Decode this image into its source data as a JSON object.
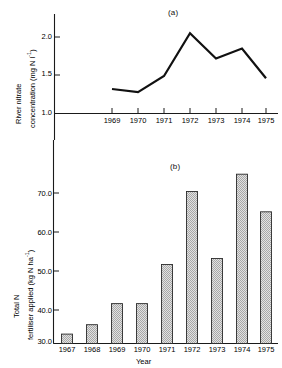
{
  "figure": {
    "panel_a_label": "(a)",
    "panel_b_label": "(b)"
  },
  "panel_a": {
    "ylabel_line1": "River nitrate",
    "ylabel_line2": "concentration (mg N l",
    "ylabel_exp": "-1",
    "ylabel_close": ")",
    "ytick_labels": [
      "2.0",
      "1.5",
      "1.0"
    ],
    "xtick_labels": [
      "1969",
      "1970",
      "1971",
      "1972",
      "1973",
      "1974",
      "1975"
    ]
  },
  "panel_b": {
    "ylabel_line1": "Total N",
    "ylabel_line2": "fertiliser applied (kg N ha",
    "ylabel_exp": "-1",
    "ylabel_close": ")",
    "ytick_labels": [
      "70.0",
      "60.0",
      "50.0",
      "40.0",
      "30.0"
    ],
    "xtick_labels": [
      "1967",
      "1968",
      "1969",
      "1970",
      "1971",
      "1972",
      "1973",
      "1974",
      "1975"
    ],
    "xlabel": "Year"
  },
  "chart_data": [
    {
      "type": "line",
      "title": "(a)",
      "xlabel": "",
      "ylabel": "River nitrate concentration (mg N l-1)",
      "x": [
        1969,
        1970,
        1971,
        1972,
        1973,
        1974,
        1975
      ],
      "categories": [
        "1969",
        "1970",
        "1971",
        "1972",
        "1973",
        "1974",
        "1975"
      ],
      "values": [
        1.32,
        1.28,
        1.49,
        2.05,
        1.72,
        1.85,
        1.46
      ],
      "yticks": [
        1.0,
        1.5,
        2.0
      ],
      "ylim": [
        1.0,
        2.2
      ],
      "grid": false,
      "legend": "none",
      "line_color": "#111111"
    },
    {
      "type": "bar",
      "title": "(b)",
      "xlabel": "Year",
      "ylabel": "Total N fertiliser applied (kg N ha-1)",
      "categories": [
        "1967",
        "1968",
        "1969",
        "1970",
        "1971",
        "1972",
        "1973",
        "1974",
        "1975"
      ],
      "values": [
        32.5,
        35.0,
        40.6,
        40.6,
        51.0,
        70.4,
        52.6,
        75.0,
        65.0
      ],
      "yticks": [
        30.0,
        40.0,
        50.0,
        60.0,
        70.0
      ],
      "ylim": [
        30.0,
        78.0
      ],
      "grid": false,
      "legend": "none",
      "bar_fill": "#d0d0d0",
      "bar_edge": "#2a2a2a"
    }
  ]
}
